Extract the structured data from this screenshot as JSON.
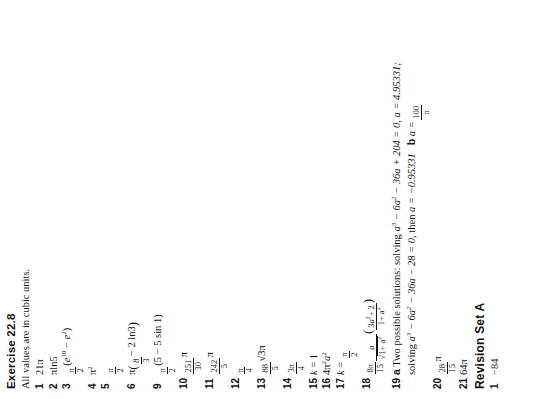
{
  "document": {
    "page_type": "textbook-answers",
    "orientation": "rotated-90-ccw"
  },
  "section": {
    "title": "Exercise 22.8",
    "preamble": "All values are in cubic units."
  },
  "answers": [
    {
      "number": "1",
      "text": "21π"
    },
    {
      "number": "2",
      "text": "πln5"
    },
    {
      "number": "3",
      "text": "π/2(e¹⁰ − e²)"
    },
    {
      "number": "4",
      "text": "π²"
    },
    {
      "number": "5",
      "text": "π/2"
    },
    {
      "number": "6",
      "text": "π(8/3 − 2 ln3)"
    },
    {
      "number": "9",
      "text": "π/2(5 − 5 sin 1)"
    },
    {
      "number": "10",
      "text": "251π/30"
    },
    {
      "number": "11",
      "text": "242π/5"
    },
    {
      "number": "12",
      "text": "π/4"
    },
    {
      "number": "13",
      "text": "88√3π/5"
    },
    {
      "number": "14",
      "text": "3π/4"
    },
    {
      "number": "15",
      "text": "k = 1"
    },
    {
      "number": "16",
      "text": "4π²a²"
    },
    {
      "number": "17",
      "text": "k = π/2"
    },
    {
      "number": "18",
      "text": "8π/15 · a/√(1+a²) (3a²+2)/(1+a²)"
    },
    {
      "number": "19",
      "text": "a Two possible solutions: solving a³ − 6a² − 36a + 204 = 0, a = 4.95331; solving a³ − 6a² − 36a − 28 = 0, then a = −0.95331   b a = 100/π"
    },
    {
      "number": "20",
      "text": "28/15 π"
    },
    {
      "number": "21",
      "text": "64π"
    }
  ],
  "item_3": {
    "frac_num": "π",
    "frac_den": "2",
    "open": "(",
    "base_e_1": "e",
    "exp_1": "10",
    "minus": "−",
    "base_e_2": "e",
    "exp_2": "2",
    "close": ")"
  },
  "item_4": {
    "base": "π",
    "exp": "2"
  },
  "item_5": {
    "num": "π",
    "den": "2"
  },
  "item_6": {
    "pi": "π",
    "open": "(",
    "num": "8",
    "den": "3",
    "rest": "− 2 ln3",
    "close": ")"
  },
  "item_9": {
    "num": "π",
    "den": "2",
    "open": "(",
    "body": "5 − 5 sin 1",
    "close": ")"
  },
  "item_10": {
    "num": "251",
    "den": "30",
    "suffix": "π"
  },
  "item_11": {
    "num": "242",
    "den": "5",
    "suffix": "π"
  },
  "item_12": {
    "num": "π",
    "den": "4"
  },
  "item_13": {
    "num": "88",
    "den": "5",
    "suffix_root": "√3",
    "suffix_pi": "π"
  },
  "item_14": {
    "num": "3π",
    "den": "4"
  },
  "item_15": {
    "var": "k",
    "eq": "= 1"
  },
  "item_16": {
    "coef": "4",
    "pi": "π",
    "pi_exp": "2",
    "var": "a",
    "var_exp": "2"
  },
  "item_17": {
    "var": "k",
    "eq": "=",
    "num": "π",
    "den": "2"
  },
  "item_18": {
    "lead_num": "8π",
    "lead_den": "15",
    "inner_num": "a",
    "inner_den_root": "√",
    "inner_den": "1+ a",
    "inner_den_exp": "2",
    "paren_num_a": "3a",
    "paren_num_exp": "2",
    "paren_num_rest": "+ 2",
    "paren_den": "1+ a",
    "paren_den_exp": "2"
  },
  "item_19": {
    "label_a": "a",
    "line1_pre": "Two possible solutions: solving ",
    "eq1": "a³ − 6a² − 36a + 204 = 0",
    "line1_mid": ", ",
    "val1": "a = 4.95331;",
    "line2_pre": "solving ",
    "eq2": "a³ − 6a² − 36a − 28 = 0",
    "line2_mid": ", then ",
    "val2": "a = −0.95331",
    "label_b": "b",
    "b_var": "a =",
    "b_num": "100",
    "b_den": "π"
  },
  "item_20": {
    "num": "28",
    "den": "15",
    "suffix": "π"
  },
  "item_21": {
    "text": "64π"
  },
  "revision": {
    "title": "Revision Set A",
    "first_number": "1",
    "first_answer": "−84"
  },
  "colors": {
    "page_background": "#ffffff",
    "text": "#141414"
  }
}
